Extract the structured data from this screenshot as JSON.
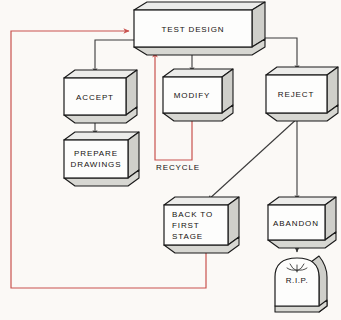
{
  "diagram": {
    "background_color": "#fbf9f6",
    "box_face_color": "#fdfdfc",
    "box_side_color": "#c9c9c4",
    "box_top_color": "#dedede",
    "outline_color": "#1a1a1a",
    "feedback_color": "#c9524e",
    "connector_color": "#3a3a3a"
  },
  "nodes": [
    {
      "id": "test-design",
      "label": "TEST DESIGN",
      "x": 134,
      "y": 10,
      "w": 118,
      "h": 37,
      "depth": 13
    },
    {
      "id": "accept",
      "label": "ACCEPT",
      "x": 64,
      "y": 78,
      "w": 62,
      "h": 37,
      "depth": 11
    },
    {
      "id": "modify",
      "label": "MODIFY",
      "x": 163,
      "y": 77,
      "w": 59,
      "h": 36,
      "depth": 11
    },
    {
      "id": "reject",
      "label": "REJECT",
      "x": 266,
      "y": 75,
      "w": 61,
      "h": 38,
      "depth": 11
    },
    {
      "id": "prepare-drawings",
      "label": "PREPARE DRAWINGS",
      "lines": [
        "PREPARE",
        "DRAWINGS"
      ],
      "x": 64,
      "y": 140,
      "w": 64,
      "h": 38,
      "depth": 11
    },
    {
      "id": "back-to-first-stage",
      "label": "BACK TO FIRST STAGE",
      "lines": [
        "BACK TO",
        "FIRST",
        "STAGE"
      ],
      "x": 164,
      "y": 205,
      "w": 64,
      "h": 40,
      "depth": 11
    },
    {
      "id": "abandon",
      "label": "ABANDON",
      "x": 268,
      "y": 205,
      "w": 57,
      "h": 35,
      "depth": 11
    }
  ],
  "tombstone": {
    "id": "rip",
    "label": "R.I.P.",
    "x": 275,
    "y": 256,
    "w": 44,
    "h": 56
  },
  "captions": [
    {
      "id": "recycle",
      "label": "RECYCLE",
      "x": 156,
      "y": 167
    }
  ],
  "edges": [
    {
      "id": "test-design-to-accept",
      "kind": "connector",
      "from": "test-design",
      "to": "accept"
    },
    {
      "id": "test-design-to-modify",
      "kind": "connector",
      "from": "test-design",
      "to": "modify"
    },
    {
      "id": "test-design-to-reject",
      "kind": "connector",
      "from": "test-design",
      "to": "reject"
    },
    {
      "id": "accept-to-prepare-drawings",
      "kind": "connector",
      "from": "accept",
      "to": "prepare-drawings"
    },
    {
      "id": "reject-to-back-to-first-stage",
      "kind": "connector",
      "from": "reject",
      "to": "back-to-first-stage"
    },
    {
      "id": "reject-to-abandon",
      "kind": "connector",
      "from": "reject",
      "to": "abandon"
    },
    {
      "id": "abandon-to-rip",
      "kind": "connector",
      "from": "abandon",
      "to": "rip"
    },
    {
      "id": "modify-recycle-to-test-design",
      "kind": "feedback",
      "from": "modify",
      "to": "test-design",
      "label": "RECYCLE"
    },
    {
      "id": "back-to-first-stage-to-test-design",
      "kind": "feedback",
      "from": "back-to-first-stage",
      "to": "test-design"
    }
  ]
}
